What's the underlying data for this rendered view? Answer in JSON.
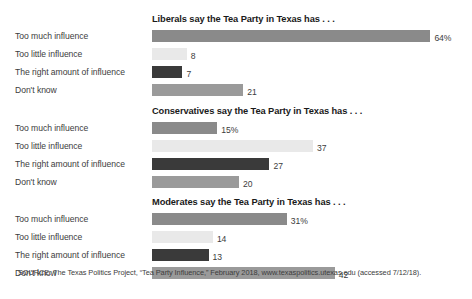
{
  "chart_data": {
    "type": "bar",
    "title": "",
    "xlabel": "",
    "ylabel": "",
    "orientation": "horizontal",
    "grid": false,
    "legend": "none",
    "xlim": [
      0,
      64
    ],
    "categories": [
      "Too much influence",
      "Too little influence",
      "The right amount of influence",
      "Don't know"
    ],
    "series": [
      {
        "name": "Liberals say the Tea Party in Texas has . . .",
        "values": [
          64,
          8,
          7,
          21
        ],
        "labels": [
          "64%",
          "8",
          "7",
          "21"
        ]
      },
      {
        "name": "Conservatives say the Tea Party in Texas has . . .",
        "values": [
          15,
          37,
          27,
          20
        ],
        "labels": [
          "15%",
          "37",
          "27",
          "20"
        ]
      },
      {
        "name": "Moderates say the Tea Party in Texas has . . .",
        "values": [
          31,
          14,
          13,
          42
        ],
        "labels": [
          "31%",
          "14",
          "13",
          "42"
        ]
      }
    ],
    "bar_colors": [
      "#8a8a8a",
      "#e9e9e9",
      "#3a3a3a",
      "#9a9a9a"
    ],
    "source": "SOURCE: The Texas Politics Project, “Tea Party Influence,” February 2018, www.texaspolitics.utexas.edu (accessed 7/12/18)."
  },
  "panels": [
    {
      "title": "Liberals say the Tea Party in Texas has . . .",
      "rows": [
        {
          "label": "Too much influence",
          "value": 64,
          "display": "64%",
          "color": "#8a8a8a"
        },
        {
          "label": "Too little influence",
          "value": 8,
          "display": "8",
          "color": "#e9e9e9"
        },
        {
          "label": "The right amount of influence",
          "value": 7,
          "display": "7",
          "color": "#3a3a3a"
        },
        {
          "label": "Don't know",
          "value": 21,
          "display": "21",
          "color": "#9a9a9a"
        }
      ]
    },
    {
      "title": "Conservatives say the Tea Party in Texas has . . .",
      "rows": [
        {
          "label": "Too much influence",
          "value": 15,
          "display": "15%",
          "color": "#8a8a8a"
        },
        {
          "label": "Too little influence",
          "value": 37,
          "display": "37",
          "color": "#e9e9e9"
        },
        {
          "label": "The right amount of influence",
          "value": 27,
          "display": "27",
          "color": "#3a3a3a"
        },
        {
          "label": "Don't know",
          "value": 20,
          "display": "20",
          "color": "#9a9a9a"
        }
      ]
    },
    {
      "title": "Moderates say the Tea Party in Texas has . . .",
      "rows": [
        {
          "label": "Too much influence",
          "value": 31,
          "display": "31%",
          "color": "#8a8a8a"
        },
        {
          "label": "Too little influence",
          "value": 14,
          "display": "14",
          "color": "#e9e9e9"
        },
        {
          "label": "The right amount of influence",
          "value": 13,
          "display": "13",
          "color": "#3a3a3a"
        },
        {
          "label": "Don't know",
          "value": 42,
          "display": "42",
          "color": "#9a9a9a"
        }
      ]
    }
  ],
  "source": {
    "text": "SOURCE: The Texas Politics Project, “Tea Party Influence,” February 2018, www.texaspolitics.utexas.edu (accessed 7/12/18)."
  },
  "scale": {
    "px_per_unit": 4.35
  }
}
